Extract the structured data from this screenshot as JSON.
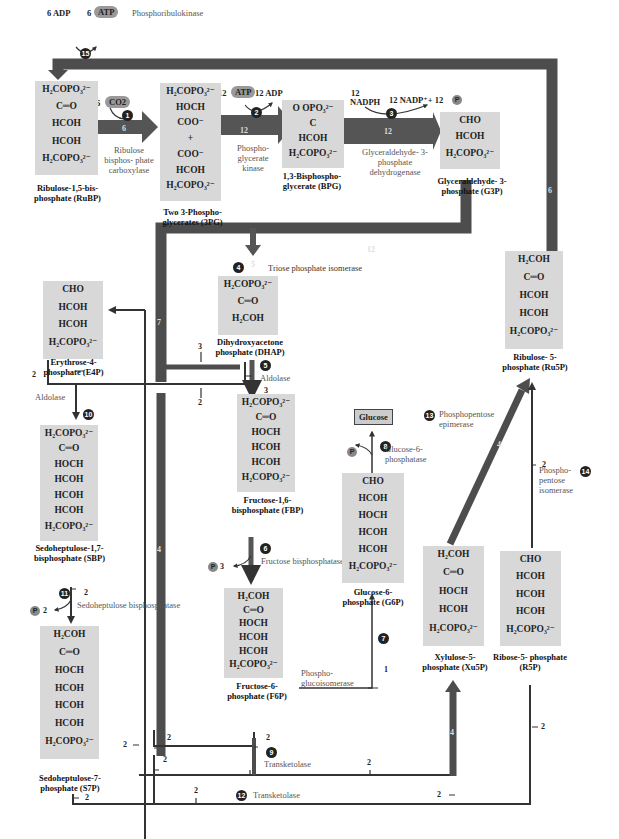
{
  "colors": {
    "arrow_dark": "#4a4a4a",
    "molecule_bg": "#d8d8d8",
    "step_circle": "#222222",
    "cofactor_pill": "#999999"
  },
  "cofactors": {
    "adp6": "6 ADP",
    "atp6_num": "6",
    "atp6": "ATP",
    "co2_num": "6",
    "co2": "CO2",
    "atp12_num": "12",
    "atp12": "ATP",
    "adp12": "12 ADP",
    "nadph_num": "12",
    "nadph": "NADPH",
    "nadp": "12 NADP⁺+ 12",
    "p": "P",
    "p_fbp": "3",
    "p_sbp": "2"
  },
  "steps": [
    "1",
    "2",
    "3",
    "4",
    "5",
    "6",
    "7",
    "8",
    "9",
    "10",
    "11",
    "12",
    "13",
    "14",
    "15"
  ],
  "enzymes": {
    "e1": "Ribulose bisphos- phate carboxylase",
    "e2": "Phospho- glycerate kinase",
    "e3": "Glyceraldehyde- 3-phosphate dehydrogenase",
    "e4": "Triose phosphate isomerase",
    "e5": "Aldolase",
    "e6": "Fructose bisphosphatase",
    "e7": "Phospho- glucoisomerase",
    "e8": "Glucose-6- phosphatase",
    "e9": "Transketolase",
    "e10": "Aldolase",
    "e11": "Sedoheptulose bisphosphatase",
    "e12": "Transketolase",
    "e13": "Phosphopentose epimerase",
    "e14": "Phospho- pentose isomerase",
    "e15": "Phosphoribulokinase"
  },
  "molecules": [
    {
      "id": "rubp",
      "name": "Ribulose-1,5-bis- phosphate (RuBP)",
      "lines": [
        "H₂COPO₃²⁻",
        "C═O",
        "HCOH",
        "HCOH",
        "H₂COPO₃²⁻"
      ]
    },
    {
      "id": "3pg",
      "name": "Two 3-Phospho- glycerates (3PG)",
      "lines": [
        "H₂COPO₃²⁻",
        "HOCH",
        "COO⁻",
        "+",
        "COO⁻",
        "HCOH",
        "H₂COPO₃²⁻"
      ]
    },
    {
      "id": "bpg",
      "name": "1,3-Bisphospho- glycerate (BPG)",
      "lines": [
        "O  OPO₃²⁻",
        "C",
        "HCOH",
        "H₂COPO₃²⁻"
      ]
    },
    {
      "id": "g3p",
      "name": "Glyceraldehyde- 3-phosphate (G3P)",
      "lines": [
        "CHO",
        "HCOH",
        "H₂COPO₃²⁻"
      ]
    },
    {
      "id": "dhap",
      "name": "Dihydroxyacetone phosphate (DHAP)",
      "lines": [
        "H₂COPO₃²⁻",
        "C═O",
        "H₂COH"
      ]
    },
    {
      "id": "e4p",
      "name": "Erythrose-4- phosphate (E4P)",
      "lines": [
        "CHO",
        "HCOH",
        "HCOH",
        "H₂COPO₃²⁻"
      ]
    },
    {
      "id": "fbp",
      "name": "Fructose-1,6- bisphosphate (FBP)",
      "lines": [
        "H₂COPO₃²⁻",
        "C═O",
        "HOCH",
        "HCOH",
        "HCOH",
        "H₂COPO₃²⁻"
      ]
    },
    {
      "id": "sbp",
      "name": "Sedoheptulose-1,7- bisphosphate (SBP)",
      "lines": [
        "H₂COPO₃²⁻",
        "C═O",
        "HOCH",
        "HCOH",
        "HCOH",
        "HCOH",
        "H₂COPO₃²⁻"
      ]
    },
    {
      "id": "g6p",
      "name": "Glucose-6- phosphate (G6P)",
      "lines": [
        "CHO",
        "HCOH",
        "HOCH",
        "HCOH",
        "HCOH",
        "H₂COPO₃²⁻"
      ]
    },
    {
      "id": "f6p",
      "name": "Fructose-6- phosphate (F6P)",
      "lines": [
        "H₂COH",
        "C═O",
        "HOCH",
        "HCOH",
        "HCOH",
        "H₂COPO₃²⁻"
      ]
    },
    {
      "id": "s7p",
      "name": "Sedoheptulose-7- phosphate (S7P)",
      "lines": [
        "H₂COH",
        "C═O",
        "HOCH",
        "HCOH",
        "HCOH",
        "HCOH",
        "H₂COPO₃²⁻"
      ]
    },
    {
      "id": "ru5p",
      "name": "Ribulose- 5-phosphate (Ru5P)",
      "lines": [
        "H₂COH",
        "C═O",
        "HCOH",
        "HCOH",
        "H₂COPO₃²⁻"
      ]
    },
    {
      "id": "xu5p",
      "name": "Xylulose-5- phosphate (Xu5P)",
      "lines": [
        "H₂COH",
        "C═O",
        "HOCH",
        "HCOH",
        "H₂COPO₃²⁻"
      ]
    },
    {
      "id": "r5p",
      "name": "Ribose-5- phosphate (R5P)",
      "lines": [
        "CHO",
        "HCOH",
        "HCOH",
        "HCOH",
        "H₂COPO₃²⁻"
      ]
    }
  ],
  "glucose": "Glucose",
  "flux": {
    "rubisco": "6",
    "pgk": "12",
    "gapdh": "12",
    "g3p_down": "12",
    "tim": "5",
    "to_ald": "7",
    "ru5p_return": "6",
    "dhap_to_ald": "3",
    "e4p_in": "2",
    "branch2": "2",
    "ald_3": "3",
    "fbp_p": "3",
    "sbp_2": "2",
    "sbp_in": "2",
    "left_2": "2",
    "tk_2a": "2",
    "tk_2b": "2",
    "f6p_2": "2",
    "g6p_1": "1",
    "tk9_2": "2",
    "tk12_2": "2",
    "xu5p_2": "2",
    "xu5p_4": "4",
    "r5p_2": "2",
    "ru5p_epi": "4",
    "s7p_2": "2",
    "ru5p_iso_2": "2",
    "left_4": "4"
  }
}
